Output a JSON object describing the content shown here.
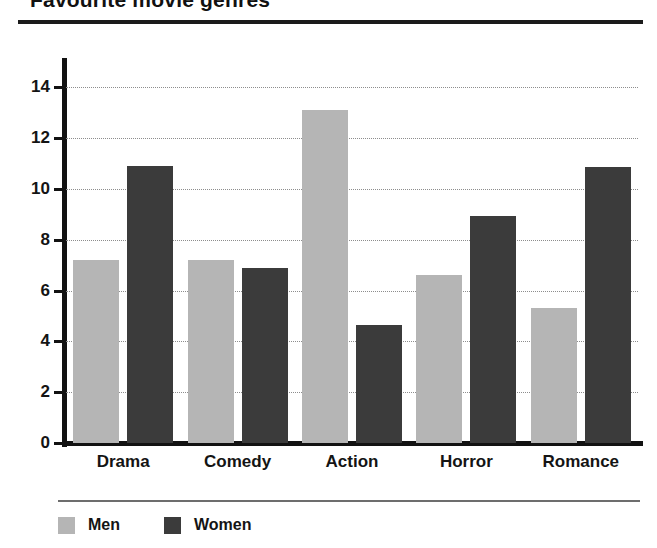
{
  "chart_data": {
    "type": "bar",
    "title": "Favourite movie genres",
    "xlabel": "",
    "ylabel": "",
    "ylim": [
      0,
      15
    ],
    "yticks": [
      0,
      2,
      4,
      6,
      8,
      10,
      12,
      14
    ],
    "grid": true,
    "legend_position": "bottom-left",
    "categories": [
      "Drama",
      "Comedy",
      "Action",
      "Horror",
      "Romance"
    ],
    "series": [
      {
        "name": "Men",
        "color": "#b5b5b5",
        "values": [
          7.2,
          7.2,
          13.1,
          6.6,
          5.3
        ]
      },
      {
        "name": "Women",
        "color": "#3b3b3b",
        "values": [
          10.9,
          6.9,
          4.65,
          8.95,
          10.85
        ]
      }
    ]
  },
  "legend": {
    "items": [
      {
        "label": "Men",
        "swatch": "men"
      },
      {
        "label": "Women",
        "swatch": "women"
      }
    ]
  }
}
